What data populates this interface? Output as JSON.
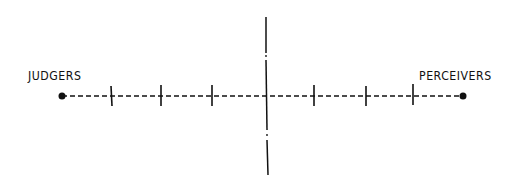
{
  "diagram": {
    "type": "bipolar-scale",
    "left_label": "JUDGERS",
    "right_label": "PERCEIVERS",
    "ink_color": "#111111",
    "background": "#ffffff",
    "axis_y": 96,
    "left_endpoint_x": 62,
    "right_endpoint_x": 463,
    "center_x": 266,
    "ticks_left_x": [
      111,
      161,
      212
    ],
    "ticks_right_x": [
      314,
      366,
      413
    ],
    "vertical_axis": {
      "top_y": 17,
      "bottom_y": 175
    }
  }
}
